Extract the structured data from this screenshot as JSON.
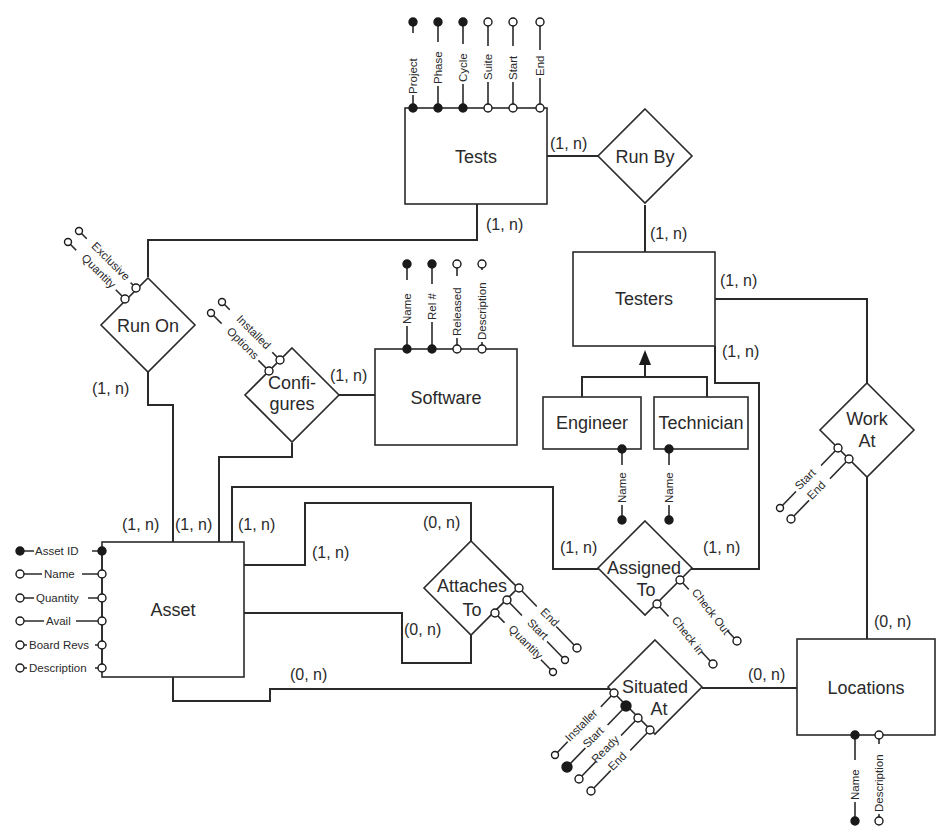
{
  "diagram": {
    "type": "entity-relationship",
    "entities": [
      {
        "id": "tests",
        "label": "Tests",
        "attributes": [
          {
            "name": "Project",
            "key": true
          },
          {
            "name": "Phase",
            "key": true
          },
          {
            "name": "Cycle",
            "key": true
          },
          {
            "name": "Suite",
            "key": false
          },
          {
            "name": "Start",
            "key": false
          },
          {
            "name": "End",
            "key": false
          }
        ]
      },
      {
        "id": "testers",
        "label": "Testers",
        "attributes": []
      },
      {
        "id": "engineer",
        "label": "Engineer",
        "attributes": [
          {
            "name": "Name",
            "key": true
          }
        ]
      },
      {
        "id": "technician",
        "label": "Technician",
        "attributes": [
          {
            "name": "Name",
            "key": true
          }
        ]
      },
      {
        "id": "software",
        "label": "Software",
        "attributes": [
          {
            "name": "Name",
            "key": true
          },
          {
            "name": "Rel #",
            "key": true
          },
          {
            "name": "Released",
            "key": false
          },
          {
            "name": "Description",
            "key": false
          }
        ]
      },
      {
        "id": "asset",
        "label": "Asset",
        "attributes": [
          {
            "name": "Asset ID",
            "key": true
          },
          {
            "name": "Name",
            "key": false
          },
          {
            "name": "Quantity",
            "key": false
          },
          {
            "name": "Avail",
            "key": false
          },
          {
            "name": "Board Revs",
            "key": false
          },
          {
            "name": "Description",
            "key": false
          }
        ]
      },
      {
        "id": "locations",
        "label": "Locations",
        "attributes": [
          {
            "name": "Name",
            "key": true
          },
          {
            "name": "Description",
            "key": false
          }
        ]
      }
    ],
    "relationships": [
      {
        "id": "run_by",
        "label": "Run By",
        "attributes": []
      },
      {
        "id": "run_on",
        "label": "Run On",
        "attributes": [
          {
            "name": "Exclusive",
            "key": false
          },
          {
            "name": "Quantity",
            "key": false
          }
        ]
      },
      {
        "id": "configures",
        "label_line1": "Confi-",
        "label_line2": "gures",
        "attributes": [
          {
            "name": "Installed",
            "key": false
          },
          {
            "name": "Options",
            "key": false
          }
        ]
      },
      {
        "id": "work_at",
        "label_line1": "Work",
        "label_line2": "At",
        "attributes": [
          {
            "name": "Start",
            "key": false
          },
          {
            "name": "End",
            "key": false
          }
        ]
      },
      {
        "id": "attaches_to",
        "label_line1": "Attaches",
        "label_line2": "To",
        "attributes": [
          {
            "name": "End",
            "key": false
          },
          {
            "name": "Start",
            "key": false
          },
          {
            "name": "Quantity",
            "key": false
          }
        ]
      },
      {
        "id": "assigned_to",
        "label_line1": "Assigned",
        "label_line2": "To",
        "attributes": [
          {
            "name": "Check Out",
            "key": false
          },
          {
            "name": "Check in",
            "key": false
          }
        ]
      },
      {
        "id": "situated_at",
        "label_line1": "Situated",
        "label_line2": "At",
        "attributes": [
          {
            "name": "Installer",
            "key": false
          },
          {
            "name": "Start",
            "key": true
          },
          {
            "name": "Ready",
            "key": false
          },
          {
            "name": "End",
            "key": false
          }
        ]
      }
    ],
    "cardinalities": {
      "tests_runby": "(1, n)",
      "runby_testers": "(1, n)",
      "tests_runon": "(1, n)",
      "runon_asset": "(1, n)",
      "configures_software": "(1, n)",
      "asset_configures": "(1, n)",
      "testers_workat": "(1, n)",
      "testers_assigned": "(1, n)",
      "assigned_testers_side": "(1, n)",
      "asset_runon_top": "(1, n)",
      "asset_assigned_top": "(1, n)",
      "asset_attaches_1": "(1, n)",
      "attaches_top": "(0, n)",
      "attaches_bottom": "(0, n)",
      "asset_assigned_side": "(1, n)",
      "asset_situated": "(0, n)",
      "situated_locations": "(0, n)",
      "workat_locations": "(0, n)"
    }
  }
}
